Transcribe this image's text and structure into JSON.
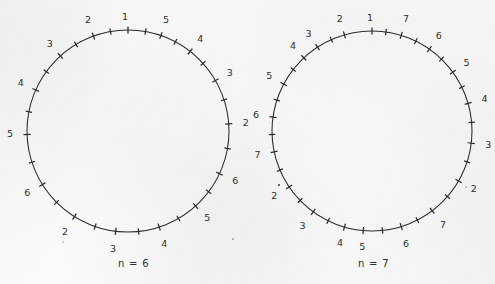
{
  "figure": {
    "background_color": "#fdfdfd",
    "ink_color": "#2b2b2b",
    "panels": [
      {
        "id": "left",
        "caption": "n = 6",
        "n": 6,
        "center_x": 128,
        "center_y": 131,
        "radius": 101,
        "ticks": [
          {
            "label": "1",
            "angle_deg": 0,
            "label_offset": 11,
            "label_dx": -3,
            "label_dy": -2
          },
          {
            "label": "5",
            "angle_deg": 19,
            "label_offset": 13,
            "label_dx": 1,
            "label_dy": -3
          },
          {
            "label": "4",
            "angle_deg": 38,
            "label_offset": 13,
            "label_dx": 2,
            "label_dy": -2
          },
          {
            "label": "3",
            "angle_deg": 60,
            "label_offset": 13,
            "label_dx": 3,
            "label_dy": -1
          },
          {
            "label": "2",
            "angle_deg": 86,
            "label_offset": 13,
            "label_dx": 4,
            "label_dy": 0
          },
          {
            "label": "6",
            "angle_deg": 115,
            "label_offset": 13,
            "label_dx": 4,
            "label_dy": 2
          },
          {
            "label": "5",
            "angle_deg": 138,
            "label_offset": 13,
            "label_dx": 3,
            "label_dy": 3
          },
          {
            "label": "4",
            "angle_deg": 162,
            "label_offset": 13,
            "label_dx": 1,
            "label_dy": 5
          },
          {
            "label": "3",
            "angle_deg": 187,
            "label_offset": 13,
            "label_dx": -1,
            "label_dy": 5
          },
          {
            "label": "2",
            "angle_deg": 212,
            "label_offset": 14,
            "label_dx": -2,
            "label_dy": 4
          },
          {
            "label": "6",
            "angle_deg": 238,
            "label_offset": 13,
            "label_dx": -4,
            "label_dy": 2
          },
          {
            "label": "5",
            "angle_deg": 268,
            "label_offset": 13,
            "label_dx": -4,
            "label_dy": 0
          },
          {
            "label": "4",
            "angle_deg": 294,
            "label_offset": 13,
            "label_dx": -3,
            "label_dy": -1
          },
          {
            "label": "3",
            "angle_deg": 318,
            "label_offset": 13,
            "label_dx": -2,
            "label_dy": -2
          },
          {
            "label": "2",
            "angle_deg": 340,
            "label_offset": 13,
            "label_dx": -1,
            "label_dy": -3
          }
        ],
        "plain_ticks_deg": [
          10,
          28,
          48,
          72,
          100,
          127,
          150,
          174,
          199,
          225,
          252,
          281,
          306,
          329,
          350
        ]
      },
      {
        "id": "right",
        "caption": "n = 7",
        "n": 7,
        "center_x": 372,
        "center_y": 131,
        "radius": 100,
        "ticks": [
          {
            "label": "1",
            "angle_deg": 0,
            "label_offset": 11,
            "label_dx": -2,
            "label_dy": -2
          },
          {
            "label": "7",
            "angle_deg": 17,
            "label_offset": 13,
            "label_dx": 1,
            "label_dy": -3
          },
          {
            "label": "6",
            "angle_deg": 35,
            "label_offset": 13,
            "label_dx": 2,
            "label_dy": -2
          },
          {
            "label": "5",
            "angle_deg": 54,
            "label_offset": 13,
            "label_dx": 3,
            "label_dy": -1
          },
          {
            "label": "4",
            "angle_deg": 74,
            "label_offset": 13,
            "label_dx": 4,
            "label_dy": 0
          },
          {
            "label": "3",
            "angle_deg": 97,
            "label_offset": 13,
            "label_dx": 4,
            "label_dy": 1
          },
          {
            "label": "2",
            "angle_deg": 120,
            "label_offset": 13,
            "label_dx": 4,
            "label_dy": 2
          },
          {
            "label": "7",
            "angle_deg": 143,
            "label_offset": 13,
            "label_dx": 3,
            "label_dy": 4
          },
          {
            "label": "6",
            "angle_deg": 163,
            "label_offset": 13,
            "label_dx": 1,
            "label_dy": 5
          },
          {
            "label": "5",
            "angle_deg": 185,
            "label_offset": 12,
            "label_dx": 0,
            "label_dy": 5
          },
          {
            "label": "4",
            "angle_deg": 196,
            "label_offset": 12,
            "label_dx": -1,
            "label_dy": 5
          },
          {
            "label": "3",
            "angle_deg": 216,
            "label_offset": 13,
            "label_dx": -3,
            "label_dy": 4
          },
          {
            "label": "2",
            "angle_deg": 236,
            "label_offset": 13,
            "label_dx": -4,
            "label_dy": 2
          },
          {
            "label": "7",
            "angle_deg": 258,
            "label_offset": 13,
            "label_dx": -4,
            "label_dy": 1
          },
          {
            "label": "6",
            "angle_deg": 278,
            "label_offset": 13,
            "label_dx": -4,
            "label_dy": 0
          },
          {
            "label": "5",
            "angle_deg": 298,
            "label_offset": 13,
            "label_dx": -3,
            "label_dy": -1
          },
          {
            "label": "4",
            "angle_deg": 317,
            "label_offset": 13,
            "label_dx": -2,
            "label_dy": -2
          },
          {
            "label": "3",
            "angle_deg": 327,
            "label_offset": 13,
            "label_dx": -2,
            "label_dy": -2
          },
          {
            "label": "2",
            "angle_deg": 344,
            "label_offset": 13,
            "label_dx": -1,
            "label_dy": -3
          }
        ],
        "plain_ticks_deg": [
          8,
          26,
          44,
          64,
          85,
          108,
          131,
          153,
          174,
          206,
          226,
          247,
          268,
          288,
          308,
          336
        ]
      }
    ],
    "specks": [
      {
        "x": 279,
        "y": 185,
        "r": 1.1
      },
      {
        "x": 233,
        "y": 239,
        "r": 0.7
      },
      {
        "x": 63,
        "y": 242,
        "r": 0.6
      },
      {
        "x": 466,
        "y": 187,
        "r": 0.6
      }
    ]
  }
}
